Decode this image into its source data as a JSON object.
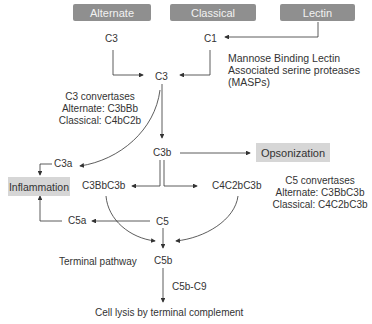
{
  "pathways": {
    "alternate": "Alternate",
    "classical": "Classical",
    "lectin": "Lectin"
  },
  "nodes": {
    "c3_alt": "C3",
    "c1": "C1",
    "c3": "C3",
    "c3b": "C3b",
    "c3a": "C3a",
    "c3bbc3b": "C3BbC3b",
    "c4c2bc3b": "C4C2bC3b",
    "c5": "C5",
    "c5a": "C5a",
    "c5b": "C5b",
    "c5b_c9": "C5b-C9"
  },
  "outcomes": {
    "opsonization": "Opsonization",
    "inflammation": "Inflammation",
    "lysis": "Cell lysis by terminal complement"
  },
  "labels": {
    "masp1": "Mannose Binding Lectin",
    "masp2": "Associated serine proteases",
    "masp3": "(MASPs)",
    "c3conv1": "C3 convertases",
    "c3conv2": "Alternate: C3bBb",
    "c3conv3": "Classical: C4bC2b",
    "c5conv1": "C5 convertases",
    "c5conv2": "Alternate: C3BbC3b",
    "c5conv3": "Classical: C4C2bC3b",
    "terminal": "Terminal pathway"
  },
  "colors": {
    "pathway_box": "#8f8f8f",
    "outcome_box": "#d6d6d6",
    "line": "#333333"
  }
}
